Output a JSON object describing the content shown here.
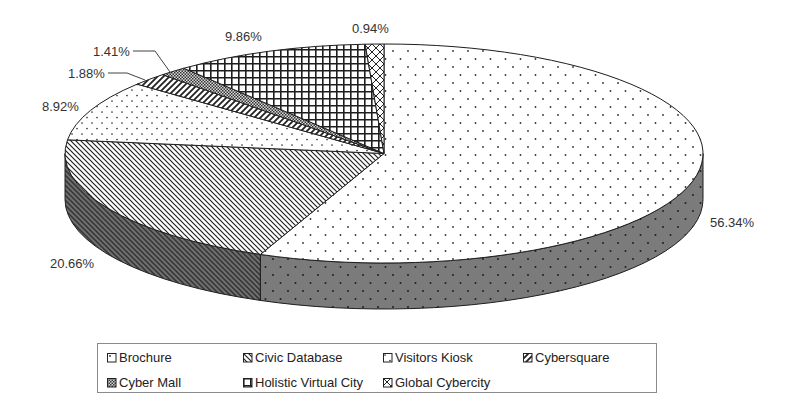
{
  "chart_data": {
    "type": "pie",
    "style": "3d-pie",
    "title": "",
    "categories": [
      "Brochure",
      "Civic Database",
      "Visitors Kiosk",
      "Cybersquare",
      "Cyber Mall",
      "Holistic Virtual City",
      "Global Cybercity"
    ],
    "values": [
      56.34,
      20.66,
      8.92,
      1.88,
      1.41,
      9.86,
      0.94
    ],
    "data_labels": [
      "56.34%",
      "20.66%",
      "8.92%",
      "1.88%",
      "1.41%",
      "9.86%",
      "0.94%"
    ],
    "patterns": [
      "sparse-dots",
      "back-diagonal",
      "dense-dots",
      "forward-diagonal",
      "fine-checker",
      "grid",
      "diagonal-cross"
    ],
    "start_angle": "12 o'clock",
    "direction": "clockwise",
    "grid": false,
    "legend": {
      "position": "bottom",
      "rows": 2,
      "columns": 4
    },
    "colors": {
      "outline": "#1e1e1e",
      "side_gray": "#7b7b7b",
      "label_text": "#333333"
    }
  }
}
